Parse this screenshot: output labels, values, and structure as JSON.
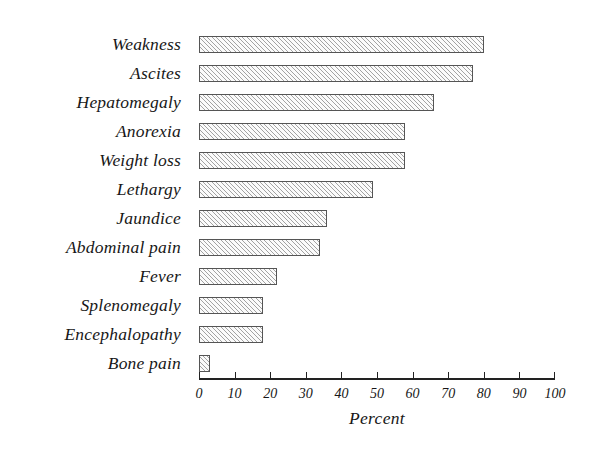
{
  "chart_data": {
    "type": "bar",
    "orientation": "horizontal",
    "title": "",
    "xlabel": "Percent",
    "ylabel": "",
    "xlim": [
      0,
      100
    ],
    "xticks": [
      "0",
      "10",
      "20",
      "30",
      "40",
      "50",
      "60",
      "70",
      "80",
      "90",
      "100"
    ],
    "xtick_values": [
      0,
      10,
      20,
      30,
      40,
      50,
      60,
      70,
      80,
      90,
      100
    ],
    "grid": false,
    "legend": false,
    "categories": [
      "Weakness",
      "Ascites",
      "Hepatomegaly",
      "Anorexia",
      "Weight  loss",
      "Lethargy",
      "Jaundice",
      "Abdominal  pain",
      "Fever",
      "Splenomegaly",
      "Encephalopathy",
      "Bone pain"
    ],
    "values": [
      80,
      77,
      66,
      58,
      58,
      49,
      36,
      34,
      22,
      18,
      18,
      3
    ],
    "bar_style": {
      "fill": "#fbfbfb",
      "hatch": "diagonal",
      "edge_color": "#555555"
    }
  }
}
